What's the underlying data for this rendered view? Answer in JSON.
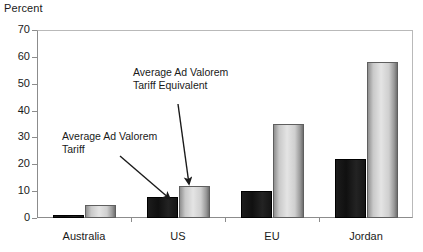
{
  "chart_data": {
    "type": "bar",
    "title": "",
    "subtitle": "",
    "xlabel": "",
    "ylabel": "Percent",
    "ylim": [
      0,
      70
    ],
    "ytick_values": [
      70,
      60,
      50,
      40,
      30,
      20,
      10,
      0
    ],
    "ytick_labels": [
      "70",
      "60",
      "50",
      "40",
      "30",
      "20",
      "10",
      "0"
    ],
    "grid": false,
    "legend_position": "none",
    "categories": [
      "Australia",
      "US",
      "EU",
      "Jordan"
    ],
    "series": [
      {
        "name": "Average Ad Valorem Tariff",
        "color": "#141414",
        "values": [
          1,
          8,
          10,
          22
        ]
      },
      {
        "name": "Average Ad Valorem Tariff Equivalent",
        "color": "#d0d0d0",
        "values": [
          5,
          12,
          35,
          58
        ]
      }
    ],
    "annotations": [
      {
        "id": "annotation-average-ad-valorem-tariff",
        "text": "Average Ad Valorem\nTariff",
        "points_to": "US Average Ad Valorem Tariff bar"
      },
      {
        "id": "annotation-average-ad-valorem-tariff-equivalent",
        "text": "Average Ad Valorem\nTariff Equivalent",
        "points_to": "US Average Ad Valorem Tariff Equivalent bar"
      }
    ]
  },
  "axis": {
    "y_title": "Percent"
  }
}
